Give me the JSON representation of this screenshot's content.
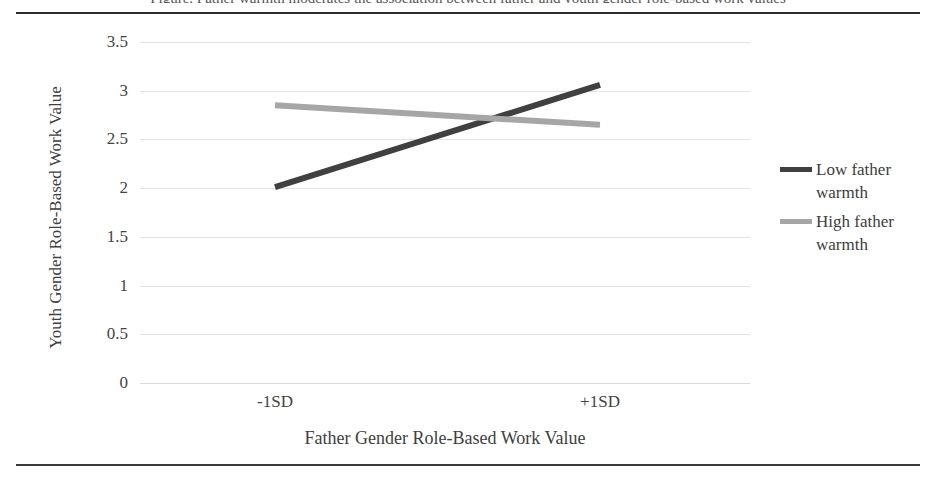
{
  "figure": {
    "clipped_title": "Figure. Father warmth moderates the association between father and youth gender role-based work values",
    "background": "#ffffff",
    "frame_color": "#2b2b2b"
  },
  "chart_data": {
    "type": "line",
    "title": "",
    "xlabel": "Father Gender Role-Based Work Value",
    "ylabel": "Youth Gender Role-Based Work Value",
    "categories": [
      "-1SD",
      "+1SD"
    ],
    "ylim": [
      0,
      3.5
    ],
    "yticks": [
      3.5,
      3,
      2.5,
      2,
      1.5,
      1,
      0.5,
      0
    ],
    "ytick_labels": [
      "3.5",
      "3",
      "2.5",
      "2",
      "1.5",
      "1",
      "0.5",
      "0"
    ],
    "grid": true,
    "legend_position": "right",
    "series": [
      {
        "name": "Low father warmth",
        "label_lines": [
          "Low father",
          "warmth"
        ],
        "values": [
          2.01,
          3.06
        ],
        "color": "#404040",
        "width": 6
      },
      {
        "name": "High father warmth",
        "label_lines": [
          "High father",
          "warmth"
        ],
        "values": [
          2.85,
          2.65
        ],
        "color": "#a6a6a6",
        "width": 6
      }
    ]
  }
}
